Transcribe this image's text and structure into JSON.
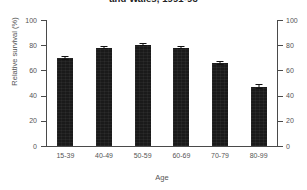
{
  "chart_data": {
    "type": "bar",
    "title": "and Wales, 1991-93",
    "xlabel": "Age",
    "ylabel": "Relative survival (%)",
    "ylim": [
      0,
      100
    ],
    "yticks": [
      0,
      20,
      40,
      60,
      80,
      100
    ],
    "yticklabels": [
      "0",
      "20",
      "40",
      "60",
      "80",
      "100"
    ],
    "right_axis": {
      "ylim": [
        0,
        100
      ],
      "yticks": [
        0,
        20,
        40,
        60,
        80,
        100
      ],
      "yticklabels": [
        "0",
        "20",
        "40",
        "60",
        "80",
        "100"
      ]
    },
    "grid": false,
    "legend": "none",
    "categories": [
      "15-39",
      "40-49",
      "50-59",
      "60-69",
      "70-79",
      "80-99"
    ],
    "values": [
      69.5,
      77.5,
      80.0,
      77.5,
      65.5,
      47.0
    ],
    "errors": [
      1.5,
      0.8,
      0.8,
      0.8,
      1.2,
      1.8
    ],
    "series": [
      {
        "name": "Relative survival",
        "values": [
          69.5,
          77.5,
          80.0,
          77.5,
          65.5,
          47.0
        ],
        "errors": [
          1.5,
          0.8,
          0.8,
          0.8,
          1.2,
          1.8
        ],
        "color": "#1a1a1a"
      }
    ]
  },
  "style": {
    "bar_color": "#1a1a1a",
    "axis_color": "#4a4a4a",
    "text_color": "#555555",
    "title_color": "#222222",
    "background": "#ffffff"
  }
}
